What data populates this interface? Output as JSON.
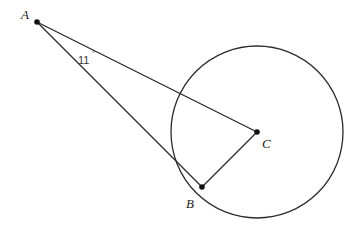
{
  "figure": {
    "stroke_color": "#2b2b2b",
    "label_color": "#1a1a1a",
    "background": "#ffffff"
  },
  "circle": {
    "name": "circle",
    "center_x": 257,
    "center_y": 132,
    "radius": 86
  },
  "points": [
    {
      "id": "A",
      "label": "A",
      "x": 37,
      "y": 22,
      "label_x": 21,
      "label_y": 19
    },
    {
      "id": "B",
      "label": "B",
      "x": 202,
      "y": 187,
      "label_x": 186,
      "label_y": 208
    },
    {
      "id": "C",
      "label": "C",
      "x": 257,
      "y": 132,
      "label_x": 262,
      "label_y": 148
    }
  ],
  "segments": [
    {
      "id": "AC",
      "from": "A",
      "to": "C",
      "x1": 37,
      "y1": 22,
      "x2": 257,
      "y2": 132
    },
    {
      "id": "AB",
      "from": "A",
      "to": "B",
      "x1": 37,
      "y1": 22,
      "x2": 202,
      "y2": 187
    },
    {
      "id": "CB",
      "from": "C",
      "to": "B",
      "x1": 257,
      "y1": 132,
      "x2": 202,
      "y2": 187
    }
  ],
  "angle": {
    "vertex": "A",
    "value": "11",
    "degree_symbol": "°",
    "text": "11°",
    "label_x": 78,
    "label_y": 64,
    "degree_x": 92,
    "degree_y": 56
  }
}
